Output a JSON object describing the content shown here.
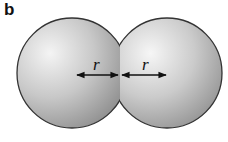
{
  "figure": {
    "panel_label": "b",
    "spheres": [
      {
        "name": "left-sphere",
        "cx": 72,
        "cy": 73,
        "r": 55
      },
      {
        "name": "right-sphere",
        "cx": 167,
        "cy": 73,
        "r": 55
      }
    ],
    "arrows": [
      {
        "name": "left-radius-arrow",
        "label": "r",
        "x1": 75,
        "x2": 119,
        "y": 75
      },
      {
        "name": "right-radius-arrow",
        "label": "r",
        "x1": 122,
        "x2": 166,
        "y": 75
      }
    ],
    "colors": {
      "sphere_light": "#f2f2f2",
      "sphere_dark": "#8a8a8a",
      "outline": "#333333",
      "arrow": "#111111"
    }
  }
}
